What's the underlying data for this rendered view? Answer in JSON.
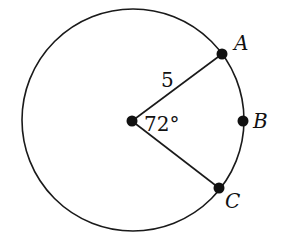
{
  "diagram": {
    "type": "circle-sector",
    "center": {
      "label": ""
    },
    "points": {
      "A": {
        "label": "A"
      },
      "B": {
        "label": "B"
      },
      "C": {
        "label": "C"
      }
    },
    "radius_label": "5",
    "angle_label": "72°",
    "stroke_color": "#1a1a1a"
  }
}
